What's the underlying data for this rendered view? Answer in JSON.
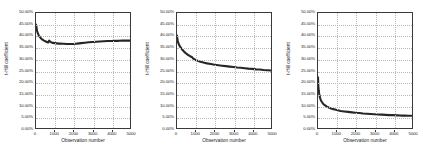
{
  "figure": {
    "background": "#ffffff",
    "panel_count": 3
  },
  "axis": {
    "y_ticks": [
      "0.00%",
      "5.00%",
      "10.00%",
      "15.00%",
      "20.00%",
      "25.00%",
      "30.00%",
      "35.00%",
      "40.00%",
      "45.00%",
      "50.00%"
    ],
    "y_tick_values": [
      0,
      5,
      10,
      15,
      20,
      25,
      30,
      35,
      40,
      45,
      50
    ],
    "x_ticks": [
      "0",
      "1000",
      "2000",
      "3000",
      "4000",
      "5000"
    ],
    "x_tick_values": [
      0,
      1000,
      2000,
      3000,
      4000,
      5000
    ],
    "xlabel": "Observation number",
    "ylabel": "Hill coefficient",
    "line_color": "#262626",
    "grid_color": "#b9b9b9",
    "frame_color": "#3a3a3a"
  },
  "chart_data": [
    {
      "type": "line",
      "title": "",
      "xlabel": "Observation number",
      "ylabel": "t-Hill coefficient",
      "xlim": [
        0,
        5000
      ],
      "ylim": [
        0,
        50
      ],
      "grid": true,
      "legend": "none",
      "x": [
        0,
        20,
        40,
        60,
        80,
        100,
        130,
        160,
        200,
        250,
        300,
        350,
        400,
        450,
        500,
        550,
        600,
        650,
        700,
        750,
        800,
        900,
        1000,
        1100,
        1200,
        1300,
        1400,
        1500,
        1600,
        1700,
        1800,
        1900,
        2000,
        2100,
        2200,
        2400,
        2600,
        2800,
        3000,
        3200,
        3400,
        3600,
        3800,
        4000,
        4200,
        4400,
        4600,
        4800,
        5000
      ],
      "y": [
        45.0,
        44.2,
        43.0,
        42.2,
        41.6,
        41.2,
        40.6,
        40.1,
        39.6,
        39.1,
        38.7,
        38.4,
        38.1,
        37.9,
        37.7,
        37.5,
        37.3,
        37.2,
        38.0,
        37.6,
        37.3,
        37.0,
        36.9,
        36.8,
        36.7,
        36.7,
        36.6,
        36.6,
        36.5,
        36.5,
        36.5,
        36.5,
        36.5,
        36.6,
        36.7,
        36.9,
        37.1,
        37.3,
        37.4,
        37.5,
        37.6,
        37.7,
        37.8,
        37.8,
        37.9,
        37.9,
        38.0,
        38.0,
        38.0
      ]
    },
    {
      "type": "line",
      "title": "",
      "xlabel": "Observation number",
      "ylabel": "t-Hill coefficient",
      "xlim": [
        0,
        5000
      ],
      "ylim": [
        0,
        50
      ],
      "grid": true,
      "legend": "none",
      "x": [
        0,
        15,
        30,
        50,
        70,
        90,
        110,
        140,
        170,
        200,
        250,
        300,
        350,
        400,
        450,
        500,
        550,
        600,
        650,
        700,
        750,
        800,
        850,
        900,
        1000,
        1100,
        1200,
        1300,
        1400,
        1500,
        1600,
        1800,
        2000,
        2200,
        2400,
        2600,
        2800,
        3000,
        3200,
        3400,
        3600,
        3800,
        4000,
        4200,
        4400,
        4600,
        4800,
        5000
      ],
      "y": [
        40.2,
        39.0,
        38.2,
        37.4,
        37.0,
        36.6,
        36.2,
        35.7,
        35.3,
        35.0,
        34.4,
        33.9,
        33.4,
        33.0,
        32.6,
        32.3,
        32.0,
        31.7,
        31.5,
        31.2,
        31.0,
        30.8,
        30.3,
        30.0,
        29.5,
        29.2,
        28.9,
        28.7,
        28.5,
        28.3,
        28.1,
        27.8,
        27.5,
        27.3,
        27.1,
        26.9,
        26.7,
        26.5,
        26.3,
        26.2,
        26.0,
        25.8,
        25.7,
        25.5,
        25.4,
        25.2,
        25.1,
        25.0
      ]
    },
    {
      "type": "line",
      "title": "",
      "xlabel": "Observation number",
      "ylabel": "t-Hill coefficient",
      "xlim": [
        0,
        5000
      ],
      "ylim": [
        0,
        50
      ],
      "grid": true,
      "legend": "none",
      "x": [
        0,
        10,
        20,
        30,
        40,
        60,
        80,
        100,
        130,
        160,
        200,
        250,
        300,
        350,
        400,
        450,
        500,
        600,
        700,
        800,
        900,
        1000,
        1200,
        1400,
        1600,
        1800,
        2000,
        2200,
        2400,
        2600,
        2800,
        3000,
        3200,
        3400,
        3600,
        3800,
        4000,
        4200,
        4400,
        4600,
        4800,
        5000
      ],
      "y": [
        22.0,
        19.5,
        18.0,
        17.0,
        16.2,
        15.0,
        14.1,
        13.4,
        12.6,
        12.0,
        11.4,
        10.8,
        10.3,
        10.0,
        9.7,
        9.4,
        9.2,
        8.8,
        8.5,
        8.2,
        8.0,
        7.8,
        7.4,
        7.2,
        7.0,
        6.8,
        6.6,
        6.5,
        6.3,
        6.2,
        6.1,
        6.0,
        5.9,
        5.8,
        5.7,
        5.6,
        5.6,
        5.5,
        5.4,
        5.4,
        5.3,
        5.3
      ]
    }
  ],
  "panels": [
    {
      "index": 0,
      "name": "panel-left"
    },
    {
      "index": 1,
      "name": "panel-middle"
    },
    {
      "index": 2,
      "name": "panel-right"
    }
  ]
}
